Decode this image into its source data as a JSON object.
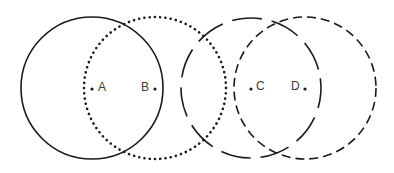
{
  "diagram": {
    "type": "overlapping-circles",
    "stroke_color": "#1a1a1a",
    "circles": [
      {
        "id": "A",
        "label": "A",
        "style": "solid",
        "cx": 92,
        "cy": 88,
        "r": 71
      },
      {
        "id": "B",
        "label": "B",
        "style": "dotted",
        "cx": 155,
        "cy": 88,
        "r": 71
      },
      {
        "id": "C",
        "label": "C",
        "style": "long-dashed",
        "cx": 251,
        "cy": 88,
        "r": 70
      },
      {
        "id": "D",
        "label": "D",
        "style": "dashed",
        "cx": 305,
        "cy": 88,
        "r": 71
      }
    ],
    "labels": {
      "a": "A",
      "b": "B",
      "c": "C",
      "d": "D"
    }
  }
}
